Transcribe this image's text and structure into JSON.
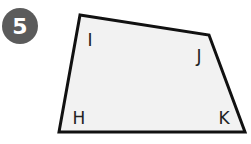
{
  "problem": {
    "number": "5",
    "badge_color": "#5b5b5b"
  },
  "shape": {
    "type": "quadrilateral",
    "fill": "#f2f2f2",
    "stroke": "#111111",
    "vertices": [
      {
        "label": "I",
        "x": 80,
        "y": 15
      },
      {
        "label": "J",
        "x": 209,
        "y": 35
      },
      {
        "label": "K",
        "x": 245,
        "y": 132
      },
      {
        "label": "H",
        "x": 59,
        "y": 132
      }
    ],
    "labels": {
      "I": "I",
      "J": "J",
      "K": "K",
      "H": "H"
    }
  }
}
